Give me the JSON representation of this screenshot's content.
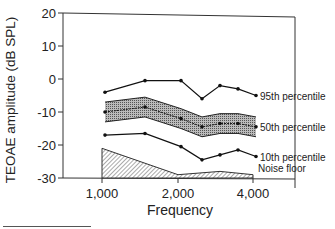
{
  "chart_data": {
    "type": "line",
    "title": "",
    "xlabel": "Frequency",
    "ylabel": "TEOAE amplitude (dB SPL)",
    "ylim": [
      -30,
      20
    ],
    "yticks": [
      20,
      10,
      0,
      -10,
      -20,
      -30
    ],
    "xtick_labels": [
      "1,000",
      "2,000",
      "4,000"
    ],
    "grid": false,
    "legend_position": "inline-right",
    "x_positions_px": [
      105,
      145,
      181,
      202,
      220,
      238,
      256
    ],
    "series": [
      {
        "name": "95th percentile",
        "values": [
          -4,
          -0.5,
          -0.5,
          -6,
          -2,
          -3,
          -5
        ]
      },
      {
        "name": "50th percentile",
        "values": [
          -10,
          -8.5,
          -12,
          -14.5,
          -13.5,
          -13.5,
          -14.5
        ],
        "band_halfwidth": 3
      },
      {
        "name": "10th percentile",
        "values": [
          -17,
          -16.5,
          -20.5,
          -24.5,
          -23,
          -21.5,
          -23.5
        ]
      },
      {
        "name": "Noise floor",
        "type": "area",
        "x_positions_px": [
          102,
          178,
          220,
          253
        ],
        "values": [
          -21,
          -29,
          -28,
          -29
        ]
      }
    ]
  },
  "labels": {
    "ylabel": "TEOAE amplitude (dB SPL)",
    "xlabel": "Frequency",
    "p95": "95th percentile",
    "p50": "50th percentile",
    "p10": "10th percentile",
    "noise": "Noise floor"
  }
}
